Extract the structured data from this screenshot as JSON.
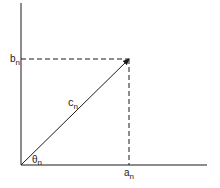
{
  "diagram": {
    "type": "vector-components",
    "colors": {
      "line": "#1a1a1a",
      "background": "#ffffff"
    },
    "labels": {
      "b": {
        "base": "b",
        "sub": "n"
      },
      "c": {
        "base": "c",
        "sub": "n"
      },
      "theta": {
        "base": "θ",
        "sub": "n"
      },
      "a": {
        "base": "a",
        "sub": "n"
      }
    }
  }
}
